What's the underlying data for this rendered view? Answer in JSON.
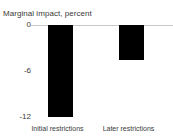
{
  "chart_data": {
    "type": "bar",
    "title": "Marginal impact, percent",
    "xlabel": "",
    "ylabel": "",
    "categories": [
      "Initial restrictions",
      "Later restrictions"
    ],
    "values": [
      -12.0,
      -4.6
    ],
    "series": [
      {
        "name": "Marginal impact",
        "values": [
          -12.0,
          -4.6
        ],
        "color": "#000000"
      }
    ],
    "ylim": [
      -12,
      0
    ],
    "yticks": [
      0,
      -6,
      -12
    ],
    "ytick_labels": [
      "0",
      "-6",
      "-12"
    ],
    "grid": false,
    "legend": false,
    "legend_position": "none",
    "zero_line_color": "#c9c9c9",
    "background_color": "#ffffff",
    "bar_color": "#000000",
    "annotations": []
  },
  "axis": {
    "ytick_0": "0",
    "ytick_1": "-6",
    "ytick_2": "-12"
  },
  "bars": {
    "bar_0_label": "Initial restrictions",
    "bar_1_label": "Later restrictions"
  }
}
